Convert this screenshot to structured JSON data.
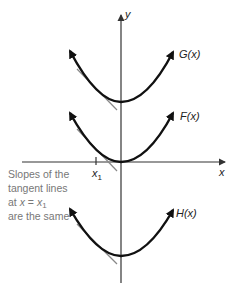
{
  "figure": {
    "axes": {
      "x_label": "x",
      "y_label": "y",
      "tick_label": "x",
      "tick_subscript": "1"
    },
    "curves": [
      {
        "id": "G",
        "label": "G(x)",
        "vertex_shift": "top"
      },
      {
        "id": "F",
        "label": "F(x)",
        "vertex_shift": "origin"
      },
      {
        "id": "H",
        "label": "H(x)",
        "vertex_shift": "bottom"
      }
    ],
    "annotation": {
      "lines": [
        "Slopes of the",
        "tangent lines",
        "at x = x",
        "are the same"
      ],
      "line3_prefix": "at ",
      "line3_var": "x",
      "line3_eq": " = ",
      "line3_x": "x",
      "line3_sub": "1"
    },
    "colors": {
      "curve": "#111111",
      "axis": "#333333",
      "tangent": "#888888",
      "annotation_text": "#777777"
    }
  }
}
